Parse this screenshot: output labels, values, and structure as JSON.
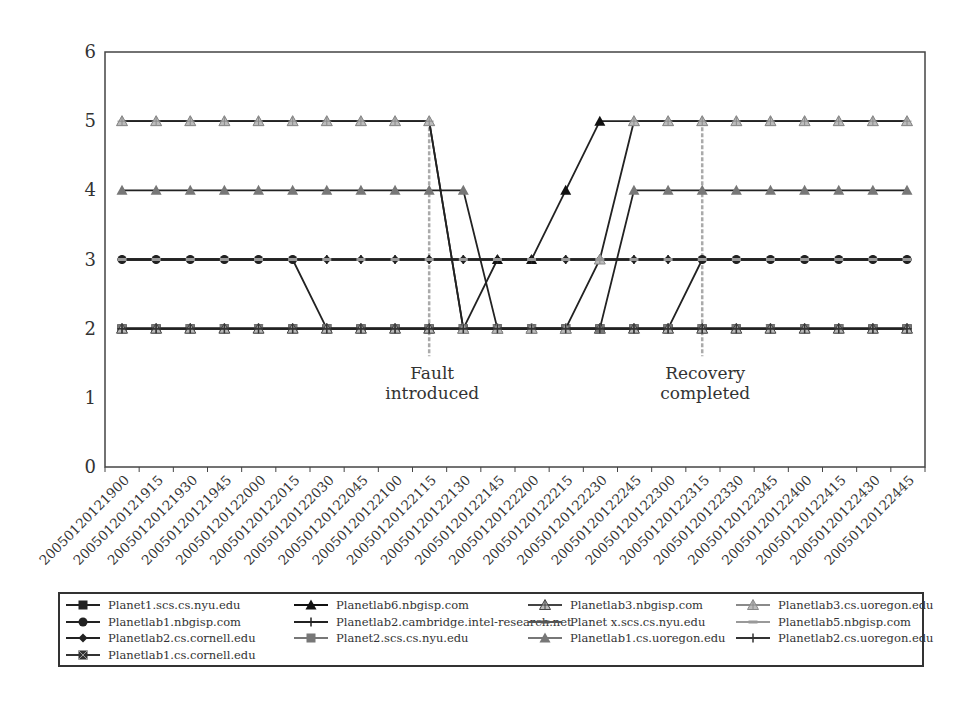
{
  "chart_data": {
    "type": "line",
    "title": "",
    "xlabel": "",
    "ylabel": "",
    "ylim": [
      0,
      6
    ],
    "yticks": [
      "0",
      "1",
      "2",
      "3",
      "4",
      "5",
      "6"
    ],
    "grid": false,
    "legend_position": "bottom",
    "categories": [
      "20050120121900",
      "20050120121915",
      "20050120121930",
      "20050120121945",
      "20050120122000",
      "20050120122015",
      "20050120122030",
      "20050120122045",
      "20050120122100",
      "20050120122115",
      "20050120122130",
      "20050120122145",
      "20050120122200",
      "20050120122215",
      "20050120122230",
      "20050120122245",
      "20050120122300",
      "20050120122315",
      "20050120122330",
      "20050120122345",
      "20050120122400",
      "20050120122415",
      "20050120122430",
      "20050120122445"
    ],
    "series": [
      {
        "name": "Planet1.scs.cs.nyu.edu",
        "marker": "square",
        "color": "#222222",
        "values": [
          2,
          2,
          2,
          2,
          2,
          2,
          2,
          2,
          2,
          2,
          2,
          2,
          2,
          2,
          2,
          2,
          2,
          2,
          2,
          2,
          2,
          2,
          2,
          2
        ]
      },
      {
        "name": "Planetlab1.nbgisp.com",
        "marker": "circle",
        "color": "#222222",
        "values": [
          3,
          3,
          3,
          3,
          3,
          3,
          2,
          2,
          2,
          2,
          2,
          2,
          2,
          2,
          2,
          2,
          2,
          3,
          3,
          3,
          3,
          3,
          3,
          3
        ]
      },
      {
        "name": "Planetlab2.cs.cornell.edu",
        "marker": "diamond",
        "color": "#222222",
        "values": [
          3,
          3,
          3,
          3,
          3,
          3,
          3,
          3,
          3,
          3,
          3,
          3,
          3,
          3,
          3,
          3,
          3,
          3,
          3,
          3,
          3,
          3,
          3,
          3
        ]
      },
      {
        "name": "Planetlab1.cs.cornell.edu",
        "marker": "xsquare",
        "color": "#333333",
        "values": [
          2,
          2,
          2,
          2,
          2,
          2,
          2,
          2,
          2,
          2,
          2,
          2,
          2,
          2,
          2,
          2,
          2,
          2,
          2,
          2,
          2,
          2,
          2,
          2
        ]
      },
      {
        "name": "Planetlab6.nbgisp.com",
        "marker": "triangle",
        "color": "#111111",
        "values": [
          5,
          5,
          5,
          5,
          5,
          5,
          5,
          5,
          5,
          5,
          2,
          3,
          3,
          4,
          5,
          5,
          5,
          5,
          5,
          5,
          5,
          5,
          5,
          5
        ]
      },
      {
        "name": "Planetlab2.cambridge.intel-research.net",
        "marker": "plus",
        "color": "#222222",
        "values": [
          3,
          3,
          3,
          3,
          3,
          3,
          3,
          3,
          3,
          3,
          3,
          3,
          3,
          3,
          3,
          3,
          3,
          3,
          3,
          3,
          3,
          3,
          3,
          3
        ]
      },
      {
        "name": "Planet2.scs.cs.nyu.edu",
        "marker": "square",
        "color": "#777777",
        "values": [
          2,
          2,
          2,
          2,
          2,
          2,
          2,
          2,
          2,
          2,
          2,
          2,
          2,
          2,
          2,
          2,
          2,
          2,
          2,
          2,
          2,
          2,
          2,
          2
        ]
      },
      {
        "name": "Planetlab3.nbgisp.com",
        "marker": "star",
        "color": "#444444",
        "values": [
          2,
          2,
          2,
          2,
          2,
          2,
          2,
          2,
          2,
          2,
          2,
          2,
          2,
          2,
          2,
          2,
          2,
          2,
          2,
          2,
          2,
          2,
          2,
          2
        ]
      },
      {
        "name": "Planet x.scs.cs.nyu.edu",
        "marker": "dash",
        "color": "#555555",
        "values": [
          3,
          3,
          3,
          3,
          3,
          3,
          3,
          3,
          3,
          3,
          3,
          3,
          3,
          3,
          3,
          3,
          3,
          3,
          3,
          3,
          3,
          3,
          3,
          3
        ]
      },
      {
        "name": "Planetlab1.cs.uoregon.edu",
        "marker": "triangle",
        "color": "#777777",
        "values": [
          4,
          4,
          4,
          4,
          4,
          4,
          4,
          4,
          4,
          4,
          4,
          2,
          2,
          2,
          2,
          4,
          4,
          4,
          4,
          4,
          4,
          4,
          4,
          4
        ]
      },
      {
        "name": "Planetlab3.cs.uoregon.edu",
        "marker": "star",
        "color": "#8a8a8a",
        "values": [
          5,
          5,
          5,
          5,
          5,
          5,
          5,
          5,
          5,
          5,
          2,
          2,
          2,
          2,
          3,
          5,
          5,
          5,
          5,
          5,
          5,
          5,
          5,
          5
        ]
      },
      {
        "name": "Planetlab5.nbgisp.com",
        "marker": "dash",
        "color": "#999999",
        "values": [
          3,
          3,
          3,
          3,
          3,
          3,
          3,
          3,
          3,
          3,
          3,
          3,
          3,
          3,
          3,
          3,
          3,
          3,
          3,
          3,
          3,
          3,
          3,
          3
        ]
      },
      {
        "name": "Planetlab2.cs.uoregon.edu",
        "marker": "plus",
        "color": "#333333",
        "values": [
          2,
          2,
          2,
          2,
          2,
          2,
          2,
          2,
          2,
          2,
          2,
          2,
          2,
          2,
          2,
          2,
          2,
          2,
          2,
          2,
          2,
          2,
          2,
          2
        ]
      }
    ],
    "annotations": [
      {
        "text_lines": [
          "Fault",
          "introduced"
        ],
        "x_category": "20050120122115",
        "y_from": 1.6,
        "y_to": 5,
        "line_style": "dashed",
        "color": "#aaaaaa"
      },
      {
        "text_lines": [
          "Recovery",
          "completed"
        ],
        "x_category": "20050120122315",
        "y_from": 1.6,
        "y_to": 5,
        "line_style": "dashed",
        "color": "#aaaaaa"
      }
    ]
  },
  "legend": {
    "columns": [
      [
        0,
        1,
        2,
        3
      ],
      [
        4,
        5,
        6
      ],
      [
        7,
        8,
        9
      ],
      [
        10,
        11,
        12
      ]
    ]
  }
}
